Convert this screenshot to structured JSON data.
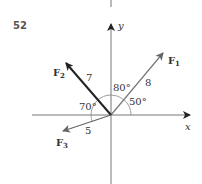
{
  "problem": {
    "number": "52"
  },
  "axes": {
    "x_label": "x",
    "y_label": "y"
  },
  "vectors": [
    {
      "name": "F",
      "subscript": "1",
      "magnitude": "8",
      "angle_label": "50°",
      "color": "#777777"
    },
    {
      "name": "F",
      "subscript": "2",
      "magnitude": "7",
      "angle_label": "80°",
      "color": "#222222"
    },
    {
      "name": "F",
      "subscript": "3",
      "magnitude": "5",
      "angle_label": "70°",
      "color": "#666666"
    }
  ]
}
